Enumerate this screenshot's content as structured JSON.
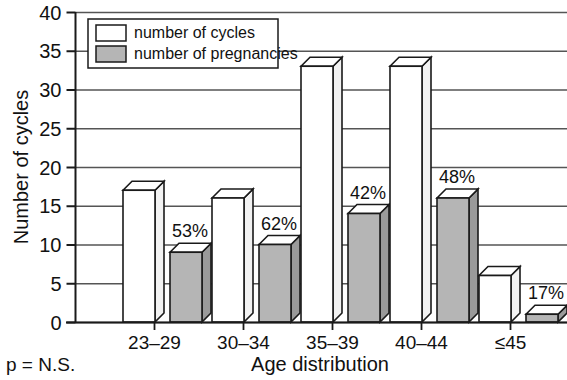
{
  "chart_data": {
    "type": "bar",
    "title": "",
    "xlabel": "Age distribution",
    "ylabel": "Number of cycles",
    "categories": [
      "23–29",
      "30–34",
      "35–39",
      "40–44",
      "≤45"
    ],
    "ylim": [
      0,
      40
    ],
    "yticks": [
      0,
      5,
      10,
      15,
      20,
      25,
      30,
      35,
      40
    ],
    "ytick_labels": [
      "0",
      "5",
      "10",
      "15",
      "20",
      "25",
      "30",
      "35",
      "40"
    ],
    "grid": true,
    "grid_axis": "y",
    "legend_position": "top-left",
    "series": [
      {
        "name": "number of cycles",
        "key": "cycles",
        "fill": "#ffffff",
        "values": [
          17,
          16,
          33,
          33,
          6
        ]
      },
      {
        "name": "number of pregnancies",
        "key": "pregnancies",
        "fill": "#b5b5b5",
        "values": [
          9,
          10,
          14,
          16,
          1
        ]
      }
    ],
    "data_labels": {
      "series": "number of pregnancies",
      "values": [
        "53%",
        "62%",
        "42%",
        "48%",
        "17%"
      ]
    },
    "annotation": "p = N.S."
  },
  "legend": {
    "items": [
      {
        "label": "number of cycles",
        "swatch": "white"
      },
      {
        "label": "number of pregnancies",
        "swatch": "gray"
      }
    ]
  },
  "axes": {
    "y_title": "Number of cycles",
    "x_title": "Age distribution"
  },
  "footer": {
    "pvalue_note": "p = N.S."
  },
  "colors": {
    "bar_outline": "#1a1a1a",
    "bar_white_fill": "#ffffff",
    "bar_gray_fill": "#b5b5b5",
    "bar_gray_side": "#9a9a9a",
    "bar_white_side": "#f2f2f2",
    "gridline": "#555555",
    "axis": "#1a1a1a",
    "text": "#111111",
    "background": "#ffffff"
  }
}
